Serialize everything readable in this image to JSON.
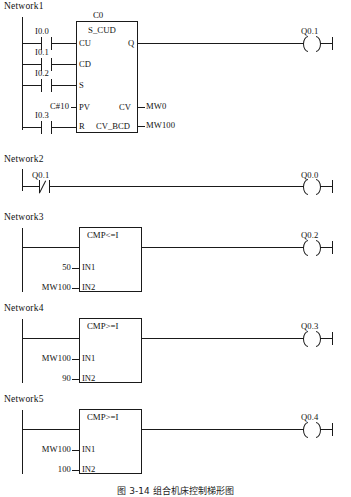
{
  "diagram": {
    "caption": "图 3-14  组合机床控制梯形图",
    "line_color": "#1a1a1a",
    "background": "#ffffff"
  },
  "networks": [
    {
      "label": "Network1",
      "contacts": [
        {
          "name": "I0.0",
          "type": "no"
        },
        {
          "name": "I0.1",
          "type": "no"
        },
        {
          "name": "I0.2",
          "type": "no"
        },
        {
          "name": "I0.3",
          "type": "no"
        }
      ],
      "block": {
        "instance": "C0",
        "title": "S_CUD",
        "inputs": [
          {
            "pin": "CU",
            "operand": ""
          },
          {
            "pin": "CD",
            "operand": ""
          },
          {
            "pin": "S",
            "operand": ""
          },
          {
            "pin": "PV",
            "operand": "C#10"
          },
          {
            "pin": "R",
            "operand": ""
          }
        ],
        "outputs": [
          {
            "pin": "Q",
            "operand": ""
          },
          {
            "pin": "CV",
            "operand": "MW0"
          },
          {
            "pin": "CV_BCD",
            "operand": "MW100"
          }
        ]
      },
      "coil": {
        "name": "Q0.1"
      }
    },
    {
      "label": "Network2",
      "contacts": [
        {
          "name": "Q0.1",
          "type": "nc"
        }
      ],
      "coil": {
        "name": "Q0.0"
      }
    },
    {
      "label": "Network3",
      "block": {
        "title": "CMP<=I",
        "inputs": [
          {
            "pin": "IN1",
            "operand": "50"
          },
          {
            "pin": "IN2",
            "operand": "MW100"
          }
        ]
      },
      "coil": {
        "name": "Q0.2"
      }
    },
    {
      "label": "Network4",
      "block": {
        "title": "CMP>=I",
        "inputs": [
          {
            "pin": "IN1",
            "operand": "MW100"
          },
          {
            "pin": "IN2",
            "operand": "90"
          }
        ]
      },
      "coil": {
        "name": "Q0.3"
      }
    },
    {
      "label": "Network5",
      "block": {
        "title": "CMP>=I",
        "inputs": [
          {
            "pin": "IN1",
            "operand": "MW100"
          },
          {
            "pin": "IN2",
            "operand": "100"
          }
        ]
      },
      "coil": {
        "name": "Q0.4"
      }
    }
  ]
}
